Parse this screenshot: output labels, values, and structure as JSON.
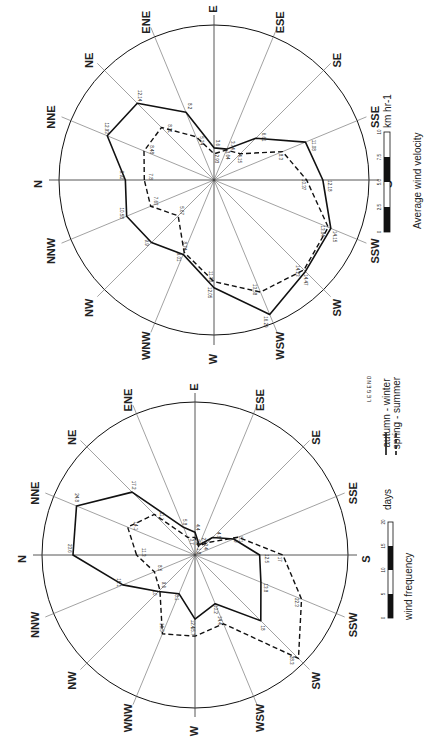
{
  "chart_data": [
    {
      "type": "radar",
      "title": "Average wind velocity",
      "units": "km hr-1",
      "directions": [
        "N",
        "NNE",
        "NE",
        "ENE",
        "E",
        "ESE",
        "SE",
        "SSE",
        "S",
        "SSW",
        "SW",
        "WSW",
        "W",
        "WNW",
        "NW",
        "NNW"
      ],
      "series": [
        {
          "name": "autumn - winter",
          "style": "solid",
          "values": [
            9.92,
            12.93,
            12.14,
            8.2,
            3.6,
            3.74,
            6.61,
            11.08,
            12.18,
            14.15,
            14.47,
            16.29,
            12.05,
            9.01,
            9.9,
            10.58
          ]
        },
        {
          "name": "spring - summer",
          "style": "dashed",
          "values": [
            7.8,
            8.48,
            8.31,
            5.24,
            2.93,
            3.64,
            4.15,
            8.3,
            10.37,
            13.84,
            14.23,
            13.58,
            11.38,
            8.74,
            5.67,
            7.67
          ]
        }
      ],
      "scale": {
        "ticks": [
          "0",
          "2.5",
          "5.0",
          "7.5",
          "10"
        ],
        "unit": "km hr-1",
        "label": "Average wind velocity"
      },
      "rmax": 17
    },
    {
      "type": "radar",
      "title": "wind frequency",
      "units": "days",
      "directions": [
        "N",
        "NNE",
        "NE",
        "ENE",
        "E",
        "ESE",
        "SE",
        "SSE",
        "S",
        "SSW",
        "SW",
        "WSW",
        "W",
        "WNW",
        "NW",
        "NNW"
      ],
      "series": [
        {
          "name": "autumn - winter",
          "style": "solid",
          "values": [
            23.6,
            24.8,
            17.2,
            5.8,
            4.4,
            2.1,
            4.8,
            8.1,
            12.5,
            13.8,
            18,
            10.2,
            12.4,
            8.1,
            10,
            15.1
          ]
        },
        {
          "name": "spring - summer",
          "style": "dashed",
          "values": [
            11.3,
            14.1,
            11.1,
            3.7,
            3.4,
            1.8,
            3.4,
            9,
            17,
            22.3,
            28.3,
            14.4,
            15.7,
            16.5,
            9.6,
            8.5
          ]
        }
      ],
      "scale": {
        "ticks": [
          "0",
          "5",
          "10",
          "15",
          "20"
        ],
        "unit": "days",
        "label": "wind frequency"
      },
      "rmax": 29
    }
  ],
  "legend": {
    "title": "LEGEND",
    "items": [
      {
        "label": "autumn - winter",
        "style": "solid"
      },
      {
        "label": "spring - summer",
        "style": "dashed"
      }
    ]
  },
  "velocity_scale": {
    "label": "Average wind velocity",
    "unit": "km hr-1",
    "ticks": [
      "0",
      "2.5",
      "5.0",
      "7.5",
      "10"
    ]
  },
  "frequency_scale": {
    "label": "wind frequency",
    "unit": "days",
    "ticks": [
      "0",
      "5",
      "10",
      "15",
      "20"
    ]
  }
}
